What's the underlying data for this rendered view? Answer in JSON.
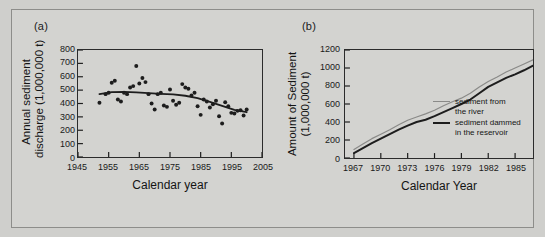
{
  "figure": {
    "background_color": "#d3d3d0",
    "ink_color": "#1d1d1d"
  },
  "panels": {
    "a": {
      "label": "(a)"
    },
    "b": {
      "label": "(b)"
    }
  },
  "chart_data": [
    {
      "panel": "(a)",
      "type": "scatter",
      "title": "",
      "xlabel": "Calendar year",
      "ylabel": "Annual sediment discharge (1,000,000 t)",
      "ylabel_line1": "Annual sediment",
      "ylabel_line2": "discharge (1,000,000 t)",
      "xlim": [
        1945,
        2005
      ],
      "ylim": [
        0,
        800
      ],
      "xticks": [
        1945,
        1955,
        1965,
        1975,
        1985,
        1995,
        2005
      ],
      "xtick_labels": [
        "1945",
        "1955",
        "1965",
        "1975",
        "1985",
        "1995",
        "2005"
      ],
      "yticks": [
        0,
        100,
        200,
        300,
        400,
        500,
        600,
        700,
        800
      ],
      "ytick_labels": [
        "0",
        "100",
        "200",
        "300",
        "400",
        "500",
        "600",
        "700",
        "800"
      ],
      "grid": false,
      "legend": null,
      "series": [
        {
          "name": "annual sediment discharge",
          "marker": "filled-circle",
          "color": "#1d1d1d",
          "x": [
            1952,
            1954,
            1955,
            1956,
            1957,
            1958,
            1959,
            1960,
            1961,
            1962,
            1963,
            1964,
            1965,
            1966,
            1967,
            1968,
            1969,
            1970,
            1971,
            1972,
            1973,
            1974,
            1975,
            1976,
            1977,
            1978,
            1979,
            1980,
            1981,
            1982,
            1983,
            1984,
            1985,
            1986,
            1987,
            1988,
            1989,
            1990,
            1991,
            1992,
            1993,
            1994,
            1995,
            1996,
            1997,
            1998,
            1999,
            2000
          ],
          "y": [
            405,
            470,
            480,
            555,
            570,
            430,
            415,
            480,
            470,
            520,
            530,
            680,
            550,
            590,
            560,
            470,
            400,
            355,
            470,
            480,
            385,
            375,
            505,
            420,
            390,
            405,
            545,
            520,
            510,
            460,
            480,
            380,
            315,
            430,
            415,
            370,
            395,
            420,
            305,
            250,
            410,
            380,
            330,
            325,
            345,
            350,
            310,
            355
          ]
        },
        {
          "name": "smoothed trend",
          "type": "line",
          "color": "#1d1d1d",
          "x": [
            1952,
            1956,
            1960,
            1964,
            1968,
            1972,
            1976,
            1980,
            1984,
            1988,
            1992,
            1996,
            2000
          ],
          "y": [
            470,
            485,
            487,
            483,
            478,
            472,
            468,
            458,
            440,
            412,
            382,
            352,
            335
          ]
        }
      ]
    },
    {
      "panel": "(b)",
      "type": "line",
      "title": "",
      "xlabel": "Calendar Year",
      "ylabel": "Amount of Sediment (1,000,000 t)",
      "ylabel_line1": "Amount of Sediment",
      "ylabel_line2": "(1,000,000 t)",
      "xlim": [
        1966,
        1987
      ],
      "ylim": [
        0,
        1200
      ],
      "xticks": [
        1967,
        1970,
        1973,
        1976,
        1979,
        1982,
        1985
      ],
      "xtick_labels": [
        "1967",
        "1970",
        "1973",
        "1976",
        "1979",
        "1982",
        "1985"
      ],
      "yticks": [
        0,
        200,
        400,
        600,
        800,
        1000,
        1200
      ],
      "ytick_labels": [
        "0",
        "200",
        "400",
        "600",
        "800",
        "1000",
        "1200"
      ],
      "grid": false,
      "legend": {
        "position": "top-left-inside",
        "entries": [
          {
            "label_line1": "sediment from",
            "label_line2": "the river",
            "style": "thin",
            "color": "#8a8a88"
          },
          {
            "label_line1": "sediment dammed",
            "label_line2": "in the reservoir",
            "style": "thick",
            "color": "#1d1d1d"
          }
        ]
      },
      "series": [
        {
          "name": "sediment from the river",
          "style": "thin",
          "color": "#8a8a88",
          "x": [
            1967,
            1968,
            1969,
            1970,
            1971,
            1972,
            1973,
            1974,
            1975,
            1976,
            1977,
            1978,
            1979,
            1980,
            1981,
            1982,
            1983,
            1984,
            1985,
            1986,
            1987
          ],
          "y": [
            95,
            155,
            215,
            265,
            315,
            370,
            420,
            455,
            490,
            530,
            580,
            625,
            665,
            720,
            790,
            850,
            900,
            955,
            1000,
            1045,
            1090
          ]
        },
        {
          "name": "sediment dammed in the reservoir",
          "style": "thick",
          "color": "#1d1d1d",
          "x": [
            1967,
            1968,
            1969,
            1970,
            1971,
            1972,
            1973,
            1974,
            1975,
            1976,
            1977,
            1978,
            1979,
            1980,
            1981,
            1982,
            1983,
            1984,
            1985,
            1986,
            1987
          ],
          "y": [
            55,
            110,
            165,
            215,
            265,
            315,
            360,
            400,
            425,
            465,
            510,
            555,
            600,
            650,
            720,
            790,
            840,
            890,
            930,
            975,
            1025
          ]
        }
      ]
    }
  ]
}
